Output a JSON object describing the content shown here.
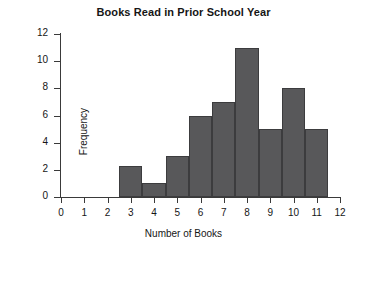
{
  "chart_data": {
    "type": "bar",
    "title": "Books Read in Prior School Year",
    "xlabel": "Number of Books",
    "ylabel": "Frequency",
    "categories": [
      3,
      4,
      5,
      6,
      7,
      8,
      9,
      10,
      11
    ],
    "values": [
      2.3,
      1,
      3,
      6,
      7,
      11,
      5,
      8,
      5
    ],
    "xlim": [
      0,
      12
    ],
    "ylim": [
      0,
      12
    ],
    "x_ticks": [
      0,
      1,
      2,
      3,
      4,
      5,
      6,
      7,
      8,
      9,
      10,
      11,
      12
    ],
    "y_ticks": [
      0,
      2,
      4,
      6,
      8,
      10,
      12
    ],
    "bar_width": 1,
    "bar_color": "#58585a",
    "bar_edge_color": "#3c3c3e",
    "axis_color": "#3a3a3a",
    "background": "#ffffff",
    "grid": false,
    "legend": null
  }
}
